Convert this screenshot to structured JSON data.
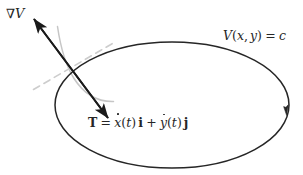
{
  "figure": {
    "name": "gradient-perpendicular-to-level-curve",
    "width": 303,
    "height": 175,
    "background_color": "#ffffff"
  },
  "colors": {
    "curve_stroke": "#262626",
    "secondary_curve_stroke": "#bfbfbf",
    "tangent_dash_stroke": "#cccccc",
    "arrow_stroke": "#1a1a1a",
    "text": "#262626"
  },
  "labels": {
    "gradient": {
      "nabla": "∇",
      "field": "V",
      "full_text": "∇V"
    },
    "level_curve": {
      "field": "V",
      "open_paren": "(",
      "x": "x",
      "comma": ",",
      "y": "y",
      "close_paren": ")",
      "equals": "=",
      "constant": "c",
      "full_text": "V(x, y) = c"
    },
    "tangent_vector": {
      "symbol": "T",
      "equals": "=",
      "x_dot": "x",
      "t_arg_open": "(",
      "t_arg": "t",
      "t_arg_close": ")",
      "i_hat": "i",
      "plus": "+",
      "y_dot": "y",
      "j_hat": "j",
      "full_text": "T = ẋ(t) i + ẏ(t) j"
    }
  },
  "shapes": {
    "level_curve_ellipse": {
      "type": "ellipse",
      "cx": 172,
      "cy": 105,
      "rx": 117,
      "ry": 63,
      "stroke_width": 1.5
    },
    "direction_arrowhead": {
      "description": "arrowhead on right side of ellipse indicating traversal direction",
      "x": 288,
      "y": 112,
      "angle_deg": 110
    },
    "neighboring_level_curve": {
      "type": "path",
      "description": "light gray secondary level curve through tangency point"
    },
    "tangent_line": {
      "type": "dashed-line",
      "description": "light gray dashed tangent line at the point"
    },
    "double_arrow": {
      "type": "double-headed-arrow",
      "tip_gradient": {
        "x": 32,
        "y": 17
      },
      "tip_tangent": {
        "x": 110,
        "y": 120
      },
      "stroke_width": 2.0
    }
  }
}
